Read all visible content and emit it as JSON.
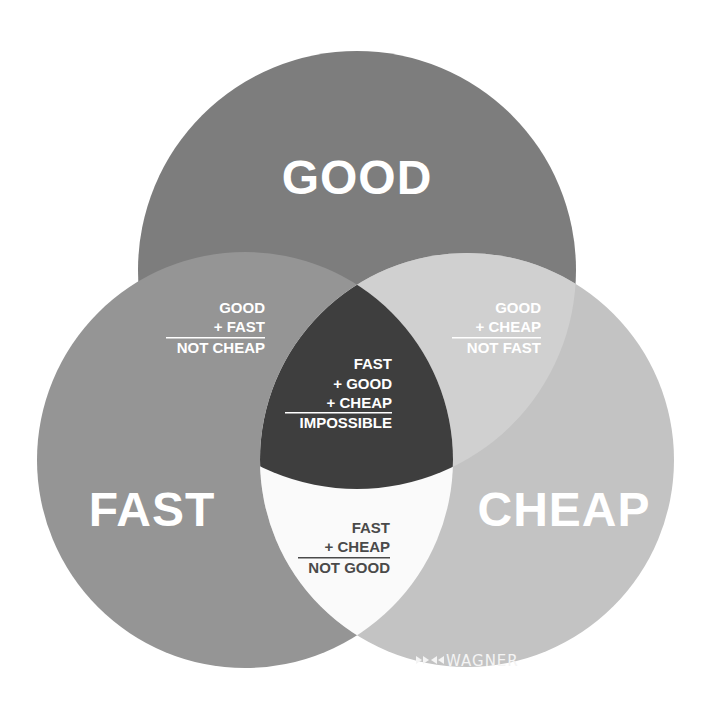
{
  "diagram": {
    "type": "venn-3",
    "sets": [
      {
        "id": "good",
        "label": "GOOD",
        "color": "#7d7d7d"
      },
      {
        "id": "fast",
        "label": "FAST",
        "color": "#959595"
      },
      {
        "id": "cheap",
        "label": "CHEAP",
        "color": "#c3c3c3"
      }
    ],
    "regions": {
      "good_fast": {
        "lines": [
          "GOOD",
          "+ FAST"
        ],
        "result": "NOT CHEAP",
        "color": "#959595",
        "text_color": "#ffffff"
      },
      "good_cheap": {
        "lines": [
          "GOOD",
          "+ CHEAP"
        ],
        "result": "NOT FAST",
        "color": "#d0d0d0",
        "text_color": "#ffffff"
      },
      "fast_cheap": {
        "lines": [
          "FAST",
          "+ CHEAP"
        ],
        "result": "NOT GOOD",
        "color": "#fafafa",
        "text_color": "#4a4a4a"
      },
      "all": {
        "lines": [
          "FAST",
          "+ GOOD",
          "+ CHEAP"
        ],
        "result": "IMPOSSIBLE",
        "color": "#3e3e3e",
        "text_color": "#ffffff"
      }
    },
    "brand": {
      "logo_glyph": "⋈",
      "name": "WAGNER",
      "color": "#f2f2f2"
    }
  }
}
